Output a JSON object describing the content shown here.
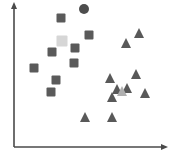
{
  "chart_data": {
    "type": "scatter",
    "title": "",
    "subtitle": "",
    "xlabel": "",
    "ylabel": "",
    "xlim": [
      0,
      176
    ],
    "ylim": [
      0,
      147
    ],
    "grid": false,
    "legend": "none",
    "axes": {
      "y_axis": {
        "x": 14,
        "y_top": 4,
        "y_bottom": 147,
        "color": "#4a4a4a",
        "arrow": "up"
      },
      "x_axis": {
        "y": 147,
        "x_left": 14,
        "x_right": 167,
        "color": "#4a4a4a",
        "arrow": "right"
      },
      "tick_labels_x": [],
      "tick_labels_y": []
    },
    "series": [
      {
        "name": "cluster-a",
        "marker": "square",
        "color": "#5a5a5a",
        "size": 9,
        "points": [
          {
            "x": 61,
            "y": 18
          },
          {
            "x": 89,
            "y": 35
          },
          {
            "x": 75,
            "y": 48
          },
          {
            "x": 52,
            "y": 52
          },
          {
            "x": 34,
            "y": 68
          },
          {
            "x": 74,
            "y": 63
          },
          {
            "x": 56,
            "y": 80
          },
          {
            "x": 51,
            "y": 92
          }
        ]
      },
      {
        "name": "cluster-a-highlight",
        "marker": "square",
        "color": "#d6d6d6",
        "size": 11,
        "points": [
          {
            "x": 62,
            "y": 41
          }
        ]
      },
      {
        "name": "cluster-a-centroid",
        "marker": "circle",
        "color": "#4d4d4d",
        "size": 10,
        "points": [
          {
            "x": 84,
            "y": 9
          }
        ]
      },
      {
        "name": "cluster-b",
        "marker": "triangle",
        "color": "#595959",
        "size": 10,
        "points": [
          {
            "x": 139,
            "y": 33
          },
          {
            "x": 126,
            "y": 43
          },
          {
            "x": 110,
            "y": 78
          },
          {
            "x": 136,
            "y": 74
          },
          {
            "x": 117,
            "y": 89
          },
          {
            "x": 127,
            "y": 88
          },
          {
            "x": 145,
            "y": 93
          },
          {
            "x": 112,
            "y": 97
          },
          {
            "x": 85,
            "y": 117
          },
          {
            "x": 112,
            "y": 117
          }
        ]
      },
      {
        "name": "cluster-b-highlight",
        "marker": "triangle",
        "color": "#b0b0b0",
        "size": 10,
        "points": [
          {
            "x": 122,
            "y": 91
          }
        ]
      }
    ]
  }
}
